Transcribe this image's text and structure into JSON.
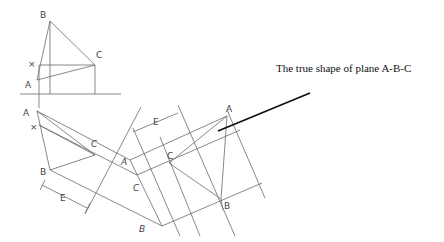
{
  "annotation": "The true shape of plane A-B-C",
  "labels": {
    "top_B": "B",
    "top_C": "C",
    "top_x": "×",
    "top_A": "A",
    "front_A": "A",
    "front_x": "×",
    "front_C": "C",
    "front_B": "B",
    "dim_E1": "E",
    "edge_A": "A",
    "edge_C": "C",
    "edge_B": "B",
    "dim_E2": "E",
    "true_C": "C",
    "true_A": "A",
    "true_B": "B"
  },
  "colors": {
    "line": "#6a6a6a",
    "leader": "#111111",
    "text": "#444444"
  }
}
